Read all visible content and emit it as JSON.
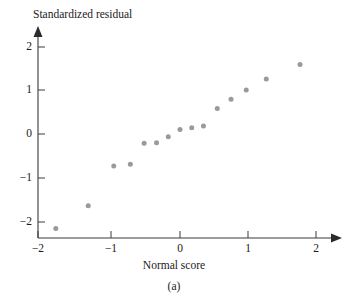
{
  "chart_data": {
    "type": "scatter",
    "title": "",
    "xlabel": "Normal score",
    "ylabel": "Standardized residual",
    "caption": "(a)",
    "xlim": [
      -2.2,
      2.2
    ],
    "ylim": [
      -2.45,
      2.25
    ],
    "xticks": [
      -2,
      -1,
      0,
      1,
      2
    ],
    "xticklabels": [
      "−2",
      "−1",
      "0",
      "1",
      "2"
    ],
    "yticks": [
      -2,
      -1,
      0,
      1,
      2
    ],
    "yticklabels": [
      "−2",
      "−1",
      "0",
      "1",
      "2"
    ],
    "grid": false,
    "legend": null,
    "point_color": "#9a9a9c",
    "axis_color": "#3a3a3a",
    "series": [
      {
        "name": "standardized residuals",
        "marker": "circle",
        "points": [
          {
            "x": -1.8,
            "y": -2.15
          },
          {
            "x": -1.33,
            "y": -1.63
          },
          {
            "x": -0.96,
            "y": -0.73
          },
          {
            "x": -0.72,
            "y": -0.69
          },
          {
            "x": -0.52,
            "y": -0.21
          },
          {
            "x": -0.34,
            "y": -0.2
          },
          {
            "x": -0.17,
            "y": -0.06
          },
          {
            "x": 0.0,
            "y": 0.1
          },
          {
            "x": 0.17,
            "y": 0.14
          },
          {
            "x": 0.34,
            "y": 0.18
          },
          {
            "x": 0.54,
            "y": 0.58
          },
          {
            "x": 0.74,
            "y": 0.79
          },
          {
            "x": 0.96,
            "y": 1.0
          },
          {
            "x": 1.25,
            "y": 1.25
          },
          {
            "x": 1.74,
            "y": 1.58
          }
        ]
      }
    ]
  }
}
